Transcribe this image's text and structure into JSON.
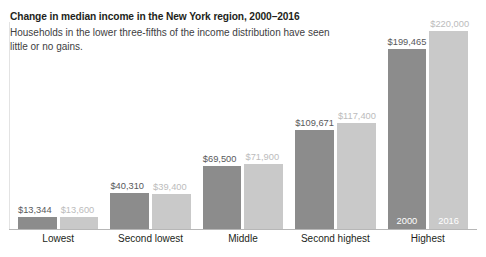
{
  "chart_data": {
    "type": "bar",
    "title": "Change in median income in the New York region, 2000–2016",
    "subtitle": "Households in the lower three-fifths of the income distribution have seen little or no gains.",
    "xlabel": "",
    "ylabel": "",
    "ylim": [
      0,
      220000
    ],
    "grid": false,
    "legend_position": "in-bar (Highest group)",
    "categories": [
      "Lowest",
      "Second lowest",
      "Middle",
      "Second highest",
      "Highest"
    ],
    "series": [
      {
        "name": "2000",
        "color": "#8c8c8c",
        "values": [
          13344,
          40310,
          69500,
          109671,
          199465
        ],
        "labels": [
          "$13,344",
          "$40,310",
          "$69,500",
          "$109,671",
          "$199,465"
        ]
      },
      {
        "name": "2016",
        "color": "#c9c9c9",
        "values": [
          13600,
          39400,
          71900,
          117400,
          220000
        ],
        "labels": [
          "$13,600",
          "$39,400",
          "$71,900",
          "$117,400",
          "$220,000"
        ]
      }
    ],
    "in_bar_labels": {
      "series_2000": "2000",
      "series_2016": "2016"
    },
    "annotations": []
  },
  "header": {
    "title": "Change in median income in the New York region, 2000–2016",
    "subtitle": "Households in the lower three-fifths of the income distribution have seen little or no gains."
  },
  "colors": {
    "series_2000": "#8c8c8c",
    "series_2016": "#c9c9c9",
    "value_label_2000": "#58595b",
    "value_label_2016": "#bcbcbc",
    "baseline": "#b7b7b7",
    "axis_left": "#e3e3e3",
    "title": "#231f20",
    "subtitle": "#414042",
    "background": "#ffffff"
  }
}
